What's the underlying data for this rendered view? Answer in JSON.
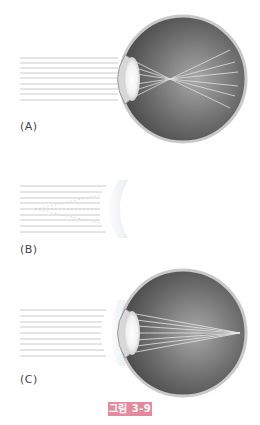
{
  "figure": {
    "caption": "그림 3-9",
    "caption_color": "#e48a9a",
    "panels": [
      {
        "id": "A",
        "label": "(A)",
        "description": "eye with parallel rays focusing in front of retina (myopia)"
      },
      {
        "id": "B",
        "label": "(B)",
        "description": "parallel rays diverged by concave lens"
      },
      {
        "id": "C",
        "label": "(C)",
        "description": "eye with corrective lens, rays focusing on retina"
      }
    ]
  }
}
